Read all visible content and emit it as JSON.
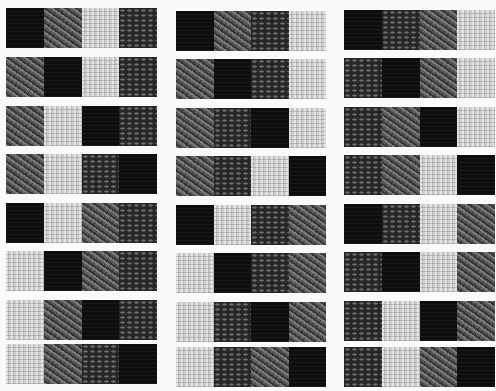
{
  "textures": {
    "K": {
      "name": "black-solid",
      "color": "#0d0d0d"
    },
    "M": {
      "name": "medium-gray-twill",
      "color": "#5a5a5a"
    },
    "L": {
      "name": "light-gray-plain",
      "color": "#cfcfcf"
    },
    "D": {
      "name": "dark-gray-oval",
      "color": "#262626"
    }
  },
  "columns": [
    {
      "x": 6,
      "width": 151,
      "rows": [
        "KMLD",
        "MKLD",
        "MLKD",
        "MLDK",
        "KLMD",
        "LKMD",
        "LMKD",
        "LMDK"
      ]
    },
    {
      "x": 176,
      "width": 150,
      "rows": [
        "KMDL",
        "MKDL",
        "MDKL",
        "MDLK",
        "KLDM",
        "LKDM",
        "LDKM",
        "LDMK"
      ]
    },
    {
      "x": 344,
      "width": 151,
      "rows": [
        "KDML",
        "DKML",
        "DMKL",
        "DMLK",
        "KDLM",
        "DKLM",
        "DLKM",
        "DLMK"
      ]
    }
  ],
  "row_tops": [
    [
      8,
      57,
      106,
      154,
      203,
      251,
      300,
      344
    ],
    [
      11,
      59,
      108,
      156,
      205,
      253,
      302,
      347
    ],
    [
      10,
      58,
      107,
      155,
      204,
      252,
      301,
      347
    ]
  ],
  "swatch_height": 40
}
